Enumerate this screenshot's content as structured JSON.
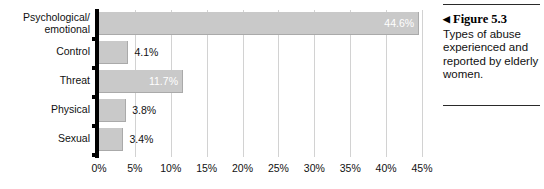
{
  "chart_data": {
    "type": "bar",
    "orientation": "horizontal",
    "title": "",
    "xlabel": "",
    "ylabel": "",
    "categories": [
      "Psychological/\nemotional",
      "Control",
      "Threat",
      "Physical",
      "Sexual"
    ],
    "values": [
      44.6,
      4.1,
      11.7,
      3.8,
      3.4
    ],
    "value_labels": [
      "44.6%",
      "4.1%",
      "11.7%",
      "3.8%",
      "3.4%"
    ],
    "label_placement": [
      "inside",
      "outside",
      "inside",
      "outside",
      "outside"
    ],
    "xlim": [
      0,
      45
    ],
    "xticks": [
      0,
      5,
      10,
      15,
      20,
      25,
      30,
      35,
      40,
      45
    ],
    "xtick_labels": [
      "0%",
      "5%",
      "10%",
      "15%",
      "20%",
      "25%",
      "30%",
      "35%",
      "40%",
      "45%"
    ],
    "grid": "vertical",
    "legend": "none",
    "bar_color": "#c9c9c9",
    "axis_color": "#000000",
    "gridline_color": "#d2d2d2"
  },
  "caption": {
    "arrow": "◀",
    "heading": "Figure 5.3",
    "body": "Types of abuse experienced and reported by elderly women."
  }
}
